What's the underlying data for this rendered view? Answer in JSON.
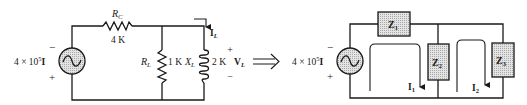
{
  "figure": {
    "left_circuit": {
      "source": {
        "label": "4 × 10",
        "exponent": "5",
        "suffix": "I",
        "polarity_top": "−",
        "polarity_bottom": "+",
        "icon": "ac-source-icon"
      },
      "rc": {
        "name": "R",
        "subscript": "C",
        "value": "4 K",
        "icon": "resistor-icon"
      },
      "rl": {
        "name": "R",
        "subscript": "L",
        "value": "1 K",
        "icon": "resistor-icon"
      },
      "xl": {
        "name": "X",
        "subscript": "L",
        "value": "2 K",
        "icon": "inductor-icon"
      },
      "current": {
        "name": "I",
        "subscript": "L",
        "icon": "current-arrow-icon"
      },
      "voltage": {
        "name": "V",
        "subscript": "L",
        "plus": "+",
        "minus": "−"
      }
    },
    "equivalence_symbol": "⟹",
    "right_circuit": {
      "source": {
        "label": "4 × 10",
        "exponent": "5",
        "suffix": "I",
        "polarity_top": "−",
        "polarity_bottom": "+",
        "icon": "ac-source-icon"
      },
      "impedances": [
        {
          "name": "Z",
          "subscript": "1"
        },
        {
          "name": "Z",
          "subscript": "2"
        },
        {
          "name": "Z",
          "subscript": "3"
        }
      ],
      "loop_currents": [
        {
          "name": "I",
          "subscript": "1"
        },
        {
          "name": "I",
          "subscript": "2"
        }
      ]
    },
    "colors": {
      "ink": "#1a1a1a",
      "shade": "#d6d6d6",
      "background": "#ffffff"
    }
  }
}
